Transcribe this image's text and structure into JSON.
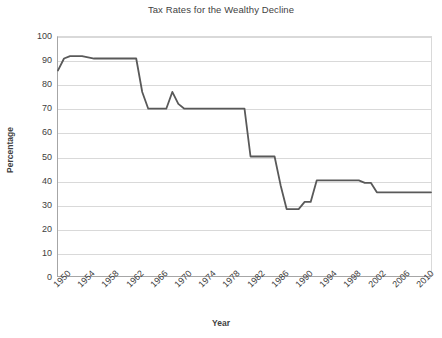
{
  "chart_data": {
    "type": "line",
    "title": "Tax Rates for the Wealthy Decline",
    "xlabel": "Year",
    "ylabel": "Percentage",
    "xlim": [
      1950,
      2012
    ],
    "ylim": [
      0,
      100
    ],
    "grid": true,
    "legend": "none",
    "line_color": "#595959",
    "ytick_labels": [
      "100",
      "90",
      "80",
      "70",
      "60",
      "50",
      "40",
      "30",
      "20",
      "10",
      "0"
    ],
    "ytick_values": [
      100,
      90,
      80,
      70,
      60,
      50,
      40,
      30,
      20,
      10,
      0
    ],
    "xtick_labels": [
      "1950",
      "1954",
      "1958",
      "1962",
      "1966",
      "1970",
      "1974",
      "1978",
      "1982",
      "1986",
      "1990",
      "1994",
      "1998",
      "2002",
      "2006",
      "2010"
    ],
    "xtick_values": [
      1950,
      1954,
      1958,
      1962,
      1966,
      1970,
      1974,
      1978,
      1982,
      1986,
      1990,
      1994,
      1998,
      2002,
      2006,
      2010
    ],
    "series": [
      {
        "name": "Top marginal tax rate",
        "x": [
          1950,
          1951,
          1952,
          1954,
          1956,
          1960,
          1963,
          1964,
          1965,
          1968,
          1969,
          1970,
          1971,
          1980,
          1981,
          1982,
          1986,
          1987,
          1988,
          1990,
          1991,
          1992,
          1993,
          2000,
          2001,
          2002,
          2003,
          2012
        ],
        "y": [
          86,
          91,
          92,
          92,
          91,
          91,
          91,
          77,
          70,
          70,
          77,
          72,
          70,
          70,
          70,
          50,
          50,
          38,
          28,
          28,
          31,
          31,
          40,
          40,
          39,
          39,
          35,
          35
        ]
      }
    ]
  }
}
